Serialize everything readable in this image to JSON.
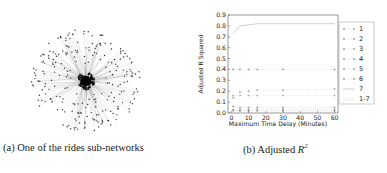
{
  "figure": {
    "panel_a": {
      "caption_prefix": "(a)",
      "caption_text": "One of the rides sub-networks",
      "description": "Network graph: dense central hub with radiating edges to scattered peripheral nodes"
    },
    "panel_b": {
      "caption_prefix": "(b)",
      "caption_text": "Adjusted ",
      "caption_math": "R",
      "caption_sup": "2"
    }
  },
  "chart_data": {
    "type": "line",
    "title": "",
    "xlabel": "Maximum Time Delay (Minutes)",
    "ylabel": "Adjusted R Squared",
    "xlim": [
      -2,
      62
    ],
    "ylim": [
      0.0,
      0.9
    ],
    "xticks": [
      0,
      10,
      20,
      30,
      40,
      50,
      60
    ],
    "yticks": [
      0.0,
      0.1,
      0.2,
      0.3,
      0.4,
      0.5,
      0.6,
      0.7,
      0.8,
      0.9
    ],
    "ytick_labels": [
      "0.0",
      "0.1",
      "0.2",
      "0.3",
      "0.4",
      "0.5",
      "0.6",
      "0.7",
      "0.8",
      "0.9"
    ],
    "grid": false,
    "legend_position": "right-outside",
    "x": [
      1,
      5,
      10,
      15,
      30,
      60
    ],
    "series": [
      {
        "name": "1",
        "values": [
          0.06,
          0.05,
          0.05,
          0.05,
          0.05,
          0.05
        ],
        "style": "dotted-markers"
      },
      {
        "name": "2",
        "values": [
          0.14,
          0.19,
          0.2,
          0.21,
          0.21,
          0.22
        ],
        "style": "dotted-markers"
      },
      {
        "name": "3",
        "values": [
          0.4,
          0.4,
          0.4,
          0.4,
          0.4,
          0.4
        ],
        "style": "dotted-markers"
      },
      {
        "name": "4",
        "values": [
          0.16,
          0.16,
          0.16,
          0.16,
          0.16,
          0.16
        ],
        "style": "dotted-markers"
      },
      {
        "name": "5",
        "values": [
          0.02,
          0.03,
          0.03,
          0.03,
          0.03,
          0.03
        ],
        "style": "dotted-markers"
      },
      {
        "name": "6",
        "values": [
          0.03,
          0.02,
          0.02,
          0.02,
          0.02,
          0.02
        ],
        "style": "dotted-markers"
      },
      {
        "name": "7",
        "values": [
          0.73,
          0.8,
          0.81,
          0.82,
          0.82,
          0.82
        ],
        "style": "solid-line"
      },
      {
        "name": "1-7",
        "values": [
          0.9,
          0.9,
          0.9,
          0.9,
          0.9,
          0.9
        ],
        "style": "dashed-line"
      }
    ]
  },
  "legend": {
    "entries": [
      "1",
      "2",
      "3",
      "4",
      "5",
      "6",
      "7",
      "1-7"
    ]
  },
  "axes": {
    "xlabel": "Maximum Time Delay (Minutes)",
    "ylabel": "Adjusted R Squared"
  }
}
